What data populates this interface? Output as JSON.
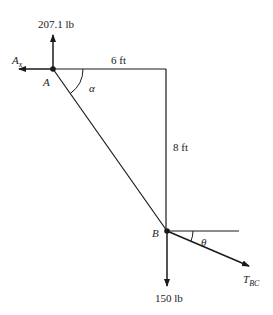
{
  "diagram": {
    "points": {
      "A": {
        "label": "A"
      },
      "B": {
        "label": "B"
      }
    },
    "forces": {
      "vertical_at_A": "207.1 lb",
      "horizontal_at_A": {
        "main": "A",
        "sub": "x"
      },
      "load_at_B": "150 lb",
      "tension": {
        "main": "T",
        "sub": "BC"
      }
    },
    "dimensions": {
      "horizontal": "6 ft",
      "vertical": "8 ft"
    },
    "angles": {
      "at_A": "α",
      "at_B": "θ"
    },
    "colors": {
      "line": "#1a1a1a",
      "background": "#ffffff"
    }
  }
}
